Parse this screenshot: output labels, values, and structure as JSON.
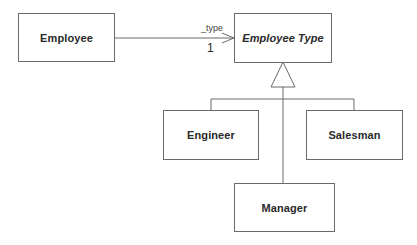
{
  "diagram": {
    "type": "UML class diagram",
    "classes": [
      {
        "id": "employee",
        "name": "Employee",
        "abstract": false
      },
      {
        "id": "employee_type",
        "name": "Employee Type",
        "abstract": true
      },
      {
        "id": "engineer",
        "name": "Engineer",
        "abstract": false
      },
      {
        "id": "salesman",
        "name": "Salesman",
        "abstract": false
      },
      {
        "id": "manager",
        "name": "Manager",
        "abstract": false
      }
    ],
    "association": {
      "from": "Employee",
      "to": "Employee Type",
      "role": "_type",
      "multiplicity": "1",
      "navigable": true
    },
    "generalization": {
      "parent": "Employee Type",
      "children": [
        "Engineer",
        "Salesman",
        "Manager"
      ]
    },
    "colors": {
      "line": "#6a6a6a",
      "text": "#2a2a2a",
      "background": "#ffffff"
    }
  }
}
